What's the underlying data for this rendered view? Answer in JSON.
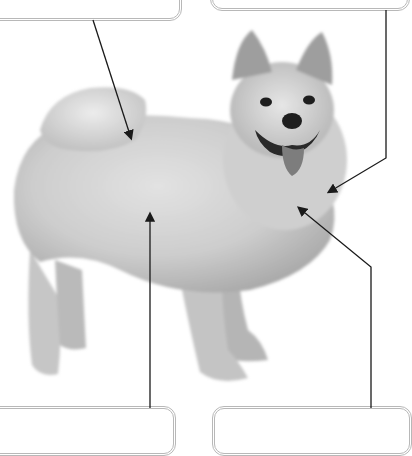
{
  "figure": {
    "palette": {
      "background": "#ffffff",
      "fur_light": "#d9d9d9",
      "fur_mid": "#bdbdbd",
      "fur_dark": "#8f8f8f",
      "features": "#1e1e1e",
      "arrow": "#1a1a1a",
      "box_border": "#b8b8b8"
    }
  },
  "callouts": [
    {
      "id": "top-left",
      "label": "",
      "target": "back / tail base"
    },
    {
      "id": "top-right",
      "label": "",
      "target": "chest / neck ruff"
    },
    {
      "id": "bottom-left",
      "label": "",
      "target": "body / belly"
    },
    {
      "id": "bottom-right",
      "label": "",
      "target": "chest"
    }
  ]
}
